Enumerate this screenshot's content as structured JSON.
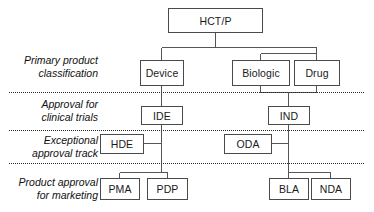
{
  "diagram": {
    "type": "flowchart-tree",
    "colors": {
      "box_border": "#4a4a4a",
      "box_fill": "#ffffff",
      "line": "#555555",
      "divider": "#2a2a2a",
      "text": "#1a1a1a",
      "background": "#ffffff"
    },
    "row_labels": [
      {
        "id": "row-primary-product-classification",
        "text": "Primary product\nclassification"
      },
      {
        "id": "row-approval-for-clinical-trials",
        "text": "Approval for\nclinical trials"
      },
      {
        "id": "row-exceptional-approval-track",
        "text": "Exceptional\napproval track"
      },
      {
        "id": "row-product-approval-for-marketing",
        "text": "Product approval\nfor marketing"
      }
    ],
    "nodes": [
      {
        "id": "hctp",
        "label": "HCT/P"
      },
      {
        "id": "device",
        "label": "Device"
      },
      {
        "id": "biologic",
        "label": "Biologic"
      },
      {
        "id": "drug",
        "label": "Drug"
      },
      {
        "id": "ide",
        "label": "IDE"
      },
      {
        "id": "ind",
        "label": "IND"
      },
      {
        "id": "hde",
        "label": "HDE"
      },
      {
        "id": "oda",
        "label": "ODA"
      },
      {
        "id": "pma",
        "label": "PMA"
      },
      {
        "id": "pdp",
        "label": "PDP"
      },
      {
        "id": "bla",
        "label": "BLA"
      },
      {
        "id": "nda",
        "label": "NDA"
      }
    ],
    "edges": [
      {
        "from": "hctp",
        "to": "device"
      },
      {
        "from": "hctp",
        "to": "biologic"
      },
      {
        "from": "hctp",
        "to": "drug"
      },
      {
        "from": "device",
        "to": "ide"
      },
      {
        "from": "biologic",
        "to": "ind"
      },
      {
        "from": "drug",
        "to": "ind"
      },
      {
        "from": "ide",
        "to": "hde"
      },
      {
        "from": "ide",
        "to": "pma"
      },
      {
        "from": "ide",
        "to": "pdp"
      },
      {
        "from": "ind",
        "to": "oda"
      },
      {
        "from": "ind",
        "to": "bla"
      },
      {
        "from": "ind",
        "to": "nda"
      }
    ]
  }
}
